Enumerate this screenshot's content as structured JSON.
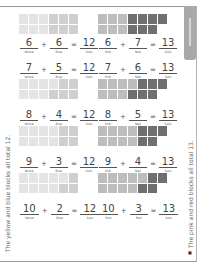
{
  "colors": {
    "yellow_block": "#e4e4e4",
    "blue_block": "#cfcfcf",
    "pink_block": "#bdbdbd",
    "red_block": "#6f6f6f",
    "empty_block": "#ffffff",
    "tab": "#a9a9a9"
  },
  "left_column": {
    "side_text": "The yellow and blue blocks all total 12.",
    "items": [
      {
        "a": "6",
        "a_label": "Yellow",
        "op": "+",
        "b": "6",
        "b_label": "Blue",
        "eq": "=",
        "sum": "12",
        "sum_label": "Sum"
      },
      {
        "a": "7",
        "a_label": "Yellow",
        "op": "+",
        "b": "5",
        "b_label": "Blue",
        "eq": "=",
        "sum": "12",
        "sum_label": "Sum"
      },
      {
        "a": "8",
        "a_label": "Yellow",
        "op": "+",
        "b": "4",
        "b_label": "Blue",
        "eq": "=",
        "sum": "12",
        "sum_label": "Sum"
      },
      {
        "a": "9",
        "a_label": "Yellow",
        "op": "+",
        "b": "3",
        "b_label": "Blue",
        "eq": "=",
        "sum": "12",
        "sum_label": "Sum"
      },
      {
        "a": "10",
        "a_label": "Yellow",
        "op": "+",
        "b": "2",
        "b_label": "Blue",
        "eq": "=",
        "sum": "12",
        "sum_label": "Sum"
      }
    ]
  },
  "right_column": {
    "side_text": "The pink and red blocks all total 13.",
    "items": [
      {
        "a": "6",
        "a_label": "Pink",
        "op": "+",
        "b": "7",
        "b_label": "Red",
        "eq": "=",
        "sum": "13",
        "sum_label": "Sum"
      },
      {
        "a": "7",
        "a_label": "Pink",
        "op": "+",
        "b": "6",
        "b_label": "Red",
        "eq": "=",
        "sum": "13",
        "sum_label": "Sum"
      },
      {
        "a": "8",
        "a_label": "Pink",
        "op": "+",
        "b": "5",
        "b_label": "Red",
        "eq": "=",
        "sum": "13",
        "sum_label": "Sum"
      },
      {
        "a": "9",
        "a_label": "Pink",
        "op": "+",
        "b": "4",
        "b_label": "Red",
        "eq": "=",
        "sum": "13",
        "sum_label": "Sum"
      },
      {
        "a": "10",
        "a_label": "Pink",
        "op": "+",
        "b": "3",
        "b_label": "Red",
        "eq": "=",
        "sum": "13",
        "sum_label": "Sum"
      }
    ]
  },
  "page_number": "■"
}
